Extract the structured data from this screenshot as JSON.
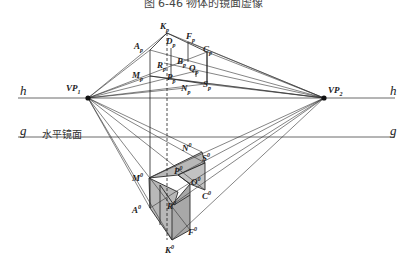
{
  "caption": "图 6-46  物体的镜面虚像",
  "lines": {
    "horizon": {
      "label_left": "h",
      "label_right": "h"
    },
    "ground": {
      "label_left": "g",
      "label_right": "g",
      "plane_label": "水平镜面"
    }
  },
  "vanishing_points": {
    "vp1": {
      "name": "VP",
      "sub": "1"
    },
    "vp2": {
      "name": "VP",
      "sub": "2"
    }
  },
  "plan_points": [
    {
      "id": "K",
      "mark": "p"
    },
    {
      "id": "A",
      "mark": "p"
    },
    {
      "id": "D",
      "mark": "p"
    },
    {
      "id": "F",
      "mark": "p"
    },
    {
      "id": "C",
      "mark": "p"
    },
    {
      "id": "B",
      "mark": "p"
    },
    {
      "id": "R",
      "mark": "p"
    },
    {
      "id": "Q",
      "mark": "p"
    },
    {
      "id": "M",
      "mark": "p"
    },
    {
      "id": "P",
      "mark": "p"
    },
    {
      "id": "N",
      "mark": "p"
    },
    {
      "id": "S",
      "mark": "p"
    }
  ],
  "mirror_points": [
    {
      "id": "N",
      "mark": "0"
    },
    {
      "id": "S",
      "mark": "0"
    },
    {
      "id": "M",
      "mark": "0"
    },
    {
      "id": "P",
      "mark": "0"
    },
    {
      "id": "O",
      "mark": "0"
    },
    {
      "id": "R",
      "mark": "0"
    },
    {
      "id": "C",
      "mark": "0"
    },
    {
      "id": "A",
      "mark": "0"
    },
    {
      "id": "F",
      "mark": "0"
    },
    {
      "id": "K",
      "mark": "0"
    }
  ],
  "colors": {
    "line": "#2a2a2a",
    "fill": "#b8b8b8",
    "fill_dark": "#a8a8a8"
  }
}
